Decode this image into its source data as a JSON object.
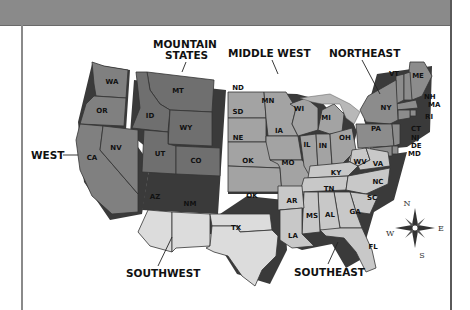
{
  "map": {
    "title": "United States Regions",
    "colors": {
      "header_band": "#8a8a8a",
      "west": "#808080",
      "mountain_states": "#6f6f6f",
      "middle_west": "#a3a3a3",
      "northeast": "#8c8c8c",
      "southwest": "#dcdcdc",
      "southeast": "#c8c8c8",
      "lakes": "#b8b8b8"
    },
    "regions": [
      {
        "id": "west",
        "label": "WEST",
        "states": [
          "WA",
          "OR",
          "CA",
          "NV"
        ]
      },
      {
        "id": "mountain",
        "label_line1": "MOUNTAIN",
        "label_line2": "STATES",
        "states": [
          "MT",
          "ID",
          "WY",
          "UT",
          "CO"
        ]
      },
      {
        "id": "midwest",
        "label": "MIDDLE WEST",
        "states": [
          "ND",
          "SD",
          "NE",
          "KS",
          "MN",
          "IA",
          "MO",
          "WI",
          "IL",
          "IN",
          "MI",
          "OH"
        ]
      },
      {
        "id": "northeast",
        "label": "NORTHEAST",
        "states": [
          "ME",
          "VT",
          "NH",
          "MA",
          "RI",
          "CT",
          "NY",
          "NJ",
          "PA",
          "DE",
          "MD"
        ]
      },
      {
        "id": "southwest",
        "label": "SOUTHWEST",
        "states": [
          "AZ",
          "NM",
          "OK",
          "TX"
        ]
      },
      {
        "id": "southeast",
        "label": "SOUTHEAST",
        "states": [
          "WV",
          "VA",
          "KY",
          "TN",
          "NC",
          "SC",
          "GA",
          "FL",
          "AL",
          "MS",
          "AR",
          "LA"
        ]
      }
    ],
    "state_labels": {
      "WA": "WA",
      "OR": "OR",
      "CA": "CA",
      "NV": "NV",
      "MT": "MT",
      "ID": "ID",
      "WY": "WY",
      "UT": "UT",
      "CO": "CO",
      "ND": "ND",
      "SD": "SD",
      "NE": "NE",
      "KS": "OK",
      "MN": "MN",
      "IA": "IA",
      "MO": "MO",
      "WI": "WI",
      "IL": "IL",
      "IN": "IN",
      "MI": "MI",
      "OH": "OH",
      "ME": "ME",
      "VT": "VT",
      "NH": "NH",
      "MA": "MA",
      "RI": "RI",
      "CT": "CT",
      "NY": "NY",
      "NJ": "NJ",
      "PA": "PA",
      "DE": "DE",
      "MD": "MD",
      "AZ": "AZ",
      "NM": "NM",
      "OK": "OK",
      "TX": "TX",
      "WV": "WV",
      "VA": "VA",
      "KY": "KY",
      "TN": "TN",
      "NC": "NC",
      "SC": "SC",
      "GA": "GA",
      "FL": "FL",
      "AL": "AL",
      "MS": "MS",
      "AR": "AR",
      "LA": "LA"
    },
    "compass": {
      "n": "N",
      "e": "E",
      "s": "S",
      "w": "W"
    }
  }
}
